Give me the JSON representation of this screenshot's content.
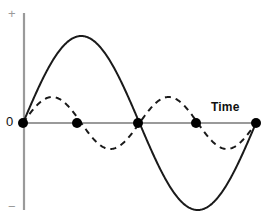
{
  "figure": {
    "width": 271,
    "height": 223,
    "background_color": "#ffffff"
  },
  "labels": {
    "positive_sign": "+",
    "negative_sign": "−",
    "zero": "0",
    "time_axis": "Time"
  },
  "colors": {
    "axis": "#9a9a9a",
    "curve": "#1a1a1a",
    "marker": "#000000",
    "label_text": "#111111",
    "sign_text": "#9a9a9a"
  },
  "chart_data": {
    "type": "line",
    "title": "",
    "xlabel": "Time",
    "ylabel": "",
    "grid": false,
    "legend": "none",
    "axes": {
      "x_axis": {
        "y_pixel": 123,
        "x_start_pixel": 23,
        "x_end_pixel": 258,
        "color": "#9a9a9a"
      },
      "y_axis": {
        "x_pixel": 24,
        "y_start_pixel": 13,
        "y_end_pixel": 210,
        "color": "#9a9a9a"
      },
      "y_tick_labels": [
        "+",
        "0",
        "−"
      ],
      "x_range_pixels": [
        23,
        256
      ],
      "y_zero_pixel": 123
    },
    "series": [
      {
        "name": "fundamental",
        "style": "solid",
        "color": "#1a1a1a",
        "line_width": 2,
        "amplitude": 1.0,
        "cycles": 1,
        "phase": 0,
        "amplitude_pixels": 87,
        "period_pixels": 233,
        "x_start_pixel": 23,
        "x_end_pixel": 256,
        "key_points": [
          {
            "label": "zero-start",
            "x": 23,
            "y": 123
          },
          {
            "label": "peak",
            "x": 80,
            "y": 36
          },
          {
            "label": "zero-mid",
            "x": 138,
            "y": 123
          },
          {
            "label": "trough",
            "x": 198,
            "y": 207
          },
          {
            "label": "zero-end",
            "x": 256,
            "y": 123
          }
        ]
      },
      {
        "name": "second-harmonic",
        "style": "dashed",
        "color": "#1a1a1a",
        "line_width": 2,
        "dash_pattern": "6 5",
        "amplitude": 0.3,
        "cycles": 2,
        "phase": 0,
        "amplitude_pixels": 26,
        "period_pixels": 116,
        "x_start_pixel": 23,
        "x_end_pixel": 256,
        "key_points": [
          {
            "label": "zero-start",
            "x": 23,
            "y": 123
          },
          {
            "label": "peak-1",
            "x": 52,
            "y": 97
          },
          {
            "label": "zero-1",
            "x": 77,
            "y": 123
          },
          {
            "label": "trough-1",
            "x": 108,
            "y": 148
          },
          {
            "label": "zero-2",
            "x": 138,
            "y": 123
          },
          {
            "label": "peak-2",
            "x": 167,
            "y": 97
          },
          {
            "label": "zero-3",
            "x": 196,
            "y": 123
          },
          {
            "label": "trough-2",
            "x": 226,
            "y": 148
          },
          {
            "label": "zero-end",
            "x": 256,
            "y": 123
          }
        ]
      }
    ],
    "markers": {
      "name": "zero-crossing-nodes",
      "shape": "filled-circle",
      "color": "#000000",
      "radius_pixels": 5,
      "points": [
        {
          "x": 23,
          "y": 123
        },
        {
          "x": 77,
          "y": 123
        },
        {
          "x": 138,
          "y": 123
        },
        {
          "x": 196,
          "y": 123
        },
        {
          "x": 256,
          "y": 123
        }
      ]
    }
  }
}
